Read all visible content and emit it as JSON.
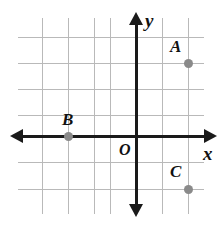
{
  "figure": {
    "kind": "coordinate-plane",
    "title": "",
    "background_color": "#ffffff",
    "grid_color": "#b9b9b9",
    "axis_color": "#1a1a1a",
    "point_color": "#8a8a8a",
    "label_color": "#111111"
  },
  "axes": {
    "x_label": "x",
    "y_label": "y",
    "origin_label": "O",
    "x_axis_px_y": 136,
    "y_axis_px_x": 136,
    "grid_spacing_px": 26,
    "arrows": [
      "left",
      "right",
      "up",
      "down"
    ],
    "tick_labels_shown": false
  },
  "grid": {
    "vertical_px": [
      42,
      68,
      94,
      110,
      136,
      162,
      188
    ],
    "horizontal_px": [
      37,
      63,
      89,
      115,
      136,
      162,
      189
    ]
  },
  "chart_data": {
    "type": "scatter",
    "title": "",
    "xlabel": "x",
    "ylabel": "y",
    "xlim": [
      -4,
      2
    ],
    "ylim": [
      -4,
      4
    ],
    "grid": true,
    "legend": "none",
    "points": [
      {
        "name": "A",
        "x": 2,
        "y": 3,
        "px": 188,
        "py": 63,
        "label": "A",
        "label_px": 170,
        "label_py": 38
      },
      {
        "name": "B",
        "x": -2.5,
        "y": 0,
        "px": 68,
        "py": 136,
        "label": "B",
        "label_px": 62,
        "label_py": 111
      },
      {
        "name": "C",
        "x": 2,
        "y": -2,
        "px": 188,
        "py": 189,
        "label": "C",
        "label_px": 170,
        "label_py": 163
      }
    ]
  }
}
